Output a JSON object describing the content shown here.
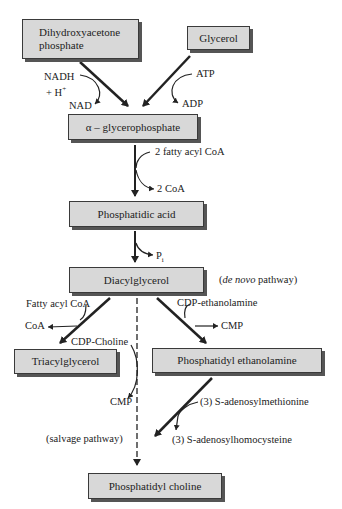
{
  "diagram": {
    "boxes": {
      "dhap": "Dihydroxyacetone phosphate",
      "dhap_line1": "Dihydroxyacetone",
      "dhap_line2": "phosphate",
      "glycerol": "Glycerol",
      "agp": "α – glycerophosphate",
      "pa": "Phosphatidic acid",
      "dag": "Diacylglycerol",
      "tag": "Triacylglycerol",
      "pe": "Phosphatidyl ethanolamine",
      "pc": "Phosphatidyl choline"
    },
    "labels": {
      "nadh": "NADH",
      "hplus": "+ H",
      "hplus_sup": "+",
      "nad": "NAD",
      "atp": "ATP",
      "adp": "ADP",
      "fatty_acyl_2": "2 fatty acyl CoA",
      "coa_2": "2 CoA",
      "pi": "P",
      "pi_sub": "i",
      "de_novo_it": "de novo",
      "de_novo_rest": " pathway)",
      "de_novo_open": "(",
      "fatty_acyl": "Fatty acyl CoA",
      "coa": "CoA",
      "cdp_eth": "CDP-ethanolamine",
      "cmp_right": "CMP",
      "cdp_choline": "CDP-Choline",
      "cmp_left": "CMP",
      "sam": "(3) S-adenosylmethionine",
      "sah": "(3) S-adenosylhomocysteine",
      "salvage": "(salvage pathway)"
    }
  }
}
